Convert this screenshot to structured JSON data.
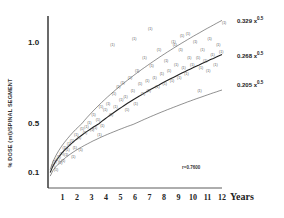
{
  "chart_data": {
    "type": "scatter",
    "title": "",
    "xlabel": "Years",
    "ylabel": "% DOSE (ml)/SPINAL SEGMENT",
    "x_ticks": [
      "1",
      "2",
      "3",
      "4",
      "5",
      "6",
      "7",
      "8",
      "9",
      "10",
      "11",
      "12"
    ],
    "y_ticks": [
      "0.1",
      "0.5",
      "1.0"
    ],
    "xlim": [
      0,
      12
    ],
    "ylim": [
      0,
      1.15
    ],
    "grid": false,
    "annotation": "r=0.7600",
    "series": [
      {
        "name": "0.329 x^0.5",
        "kind": "fit_curve",
        "coef": 0.329,
        "exp": 0.5,
        "style": "thin"
      },
      {
        "name": "0.268 x^0.5",
        "kind": "fit_curve",
        "coef": 0.268,
        "exp": 0.5,
        "style": "thick"
      },
      {
        "name": "0.205 x^0.5",
        "kind": "fit_curve",
        "coef": 0.205,
        "exp": 0.5,
        "style": "thin"
      },
      {
        "name": "patients",
        "kind": "points",
        "x": [
          0.2,
          0.3,
          0.4,
          0.5,
          0.6,
          0.7,
          0.8,
          0.9,
          1.0,
          1.1,
          1.2,
          1.3,
          1.5,
          1.7,
          1.8,
          2.0,
          2.2,
          2.4,
          2.5,
          2.7,
          2.9,
          3.0,
          3.1,
          3.3,
          3.5,
          3.6,
          3.8,
          4.0,
          4.2,
          4.4,
          4.5,
          4.7,
          4.9,
          5.0,
          5.2,
          5.3,
          5.5,
          5.7,
          5.9,
          6.0,
          6.2,
          6.4,
          6.5,
          6.7,
          6.8,
          7.0,
          7.2,
          7.4,
          7.5,
          7.7,
          7.9,
          8.0,
          8.2,
          8.4,
          8.5,
          8.7,
          8.9,
          9.0,
          9.2,
          9.4,
          9.5,
          9.6,
          9.8,
          10.0,
          10.2,
          10.4,
          10.5,
          10.7,
          10.9,
          11.0,
          11.2,
          11.4,
          11.6,
          11.8,
          12.0,
          4.3,
          5.8,
          6.9,
          8.6,
          9.1,
          10.3,
          3.4,
          2.1,
          1.6
        ],
        "y": [
          0.15,
          0.18,
          0.12,
          0.2,
          0.22,
          0.17,
          0.25,
          0.19,
          0.3,
          0.24,
          0.28,
          0.33,
          0.35,
          0.3,
          0.4,
          0.38,
          0.45,
          0.42,
          0.47,
          0.5,
          0.44,
          0.55,
          0.46,
          0.52,
          0.6,
          0.48,
          0.58,
          0.62,
          0.55,
          0.68,
          0.6,
          0.72,
          0.64,
          0.75,
          0.66,
          0.58,
          0.78,
          0.7,
          0.62,
          0.82,
          0.74,
          0.68,
          0.9,
          0.76,
          0.7,
          0.85,
          0.78,
          0.72,
          0.95,
          0.8,
          0.74,
          0.88,
          0.82,
          0.76,
          1.0,
          0.86,
          0.78,
          0.95,
          0.84,
          0.8,
          1.05,
          0.9,
          0.86,
          1.0,
          0.9,
          0.84,
          0.95,
          0.88,
          0.82,
          1.02,
          0.92,
          0.86,
          0.98,
          0.94,
          1.12,
          0.98,
          1.02,
          1.08,
          0.98,
          1.04,
          0.7,
          0.4,
          0.28,
          0.22
        ]
      }
    ],
    "legend": {
      "position": "right, inline labels at curve ends"
    }
  },
  "labels": {
    "eq_upper": "0.329 x",
    "eq_middle": "0.268 x",
    "eq_lower": "0.205 x",
    "eq_exp": "0.5",
    "r_value": "r=0.7600",
    "years": "Years",
    "ylabel": "% DOSE (ml)/SPINAL SEGMENT"
  }
}
